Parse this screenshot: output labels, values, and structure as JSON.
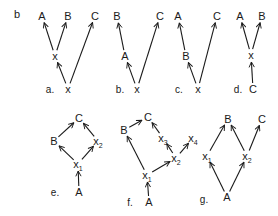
{
  "figure_label": "b",
  "colors": {
    "ink": "#1a1a1a",
    "background": "#ffffff"
  },
  "panels": [
    {
      "id": "a",
      "caption": "a.",
      "caption_pos": [
        50,
        93
      ],
      "nodes": [
        {
          "id": "A",
          "label": "A",
          "pos": [
            42,
            20
          ]
        },
        {
          "id": "B",
          "label": "B",
          "pos": [
            68,
            20
          ]
        },
        {
          "id": "C",
          "label": "C",
          "pos": [
            95,
            20
          ]
        },
        {
          "id": "x",
          "label": "x",
          "pos": [
            55,
            60
          ]
        },
        {
          "id": "x0",
          "label": "x",
          "pos": [
            68,
            93
          ]
        }
      ],
      "edges": [
        [
          "x0",
          "x"
        ],
        [
          "x",
          "A"
        ],
        [
          "x",
          "B"
        ],
        [
          "x0",
          "C"
        ]
      ]
    },
    {
      "id": "b",
      "caption": "b.",
      "caption_pos": [
        120,
        93
      ],
      "nodes": [
        {
          "id": "B",
          "label": "B",
          "pos": [
            117,
            20
          ]
        },
        {
          "id": "C",
          "label": "C",
          "pos": [
            160,
            20
          ]
        },
        {
          "id": "A",
          "label": "A",
          "pos": [
            125,
            60
          ]
        },
        {
          "id": "x",
          "label": "x",
          "pos": [
            137,
            93
          ]
        }
      ],
      "edges": [
        [
          "x",
          "A"
        ],
        [
          "A",
          "B"
        ],
        [
          "x",
          "C"
        ]
      ]
    },
    {
      "id": "c",
      "caption": "c.",
      "caption_pos": [
        179,
        93
      ],
      "nodes": [
        {
          "id": "A",
          "label": "A",
          "pos": [
            178,
            20
          ]
        },
        {
          "id": "C",
          "label": "C",
          "pos": [
            217,
            20
          ]
        },
        {
          "id": "B",
          "label": "B",
          "pos": [
            186,
            60
          ]
        },
        {
          "id": "x",
          "label": "x",
          "pos": [
            198,
            93
          ]
        }
      ],
      "edges": [
        [
          "x",
          "B"
        ],
        [
          "B",
          "A"
        ],
        [
          "x",
          "C"
        ]
      ]
    },
    {
      "id": "d",
      "caption": "d.",
      "caption_pos": [
        238,
        93
      ],
      "nodes": [
        {
          "id": "A",
          "label": "A",
          "pos": [
            240,
            20
          ]
        },
        {
          "id": "B",
          "label": "B",
          "pos": [
            262,
            20
          ]
        },
        {
          "id": "x",
          "label": "x",
          "pos": [
            251,
            59
          ]
        },
        {
          "id": "C",
          "label": "C",
          "pos": [
            253,
            93
          ]
        }
      ],
      "edges": [
        [
          "C",
          "x"
        ],
        [
          "x",
          "A"
        ],
        [
          "x",
          "B"
        ]
      ]
    },
    {
      "id": "e",
      "caption": "e.",
      "caption_pos": [
        55,
        196
      ],
      "nodes": [
        {
          "id": "C",
          "label": "C",
          "sub": "",
          "pos": [
            79,
            122
          ]
        },
        {
          "id": "B",
          "label": "B",
          "sub": "",
          "pos": [
            54,
            145
          ]
        },
        {
          "id": "x2",
          "label": "x",
          "sub": "2",
          "pos": [
            98,
            145
          ]
        },
        {
          "id": "x1",
          "label": "x",
          "sub": "1",
          "pos": [
            78,
            168
          ]
        },
        {
          "id": "A",
          "label": "A",
          "sub": "",
          "pos": [
            79,
            196
          ]
        }
      ],
      "edges": [
        [
          "A",
          "x1"
        ],
        [
          "x1",
          "B"
        ],
        [
          "x1",
          "x2"
        ],
        [
          "B",
          "C"
        ],
        [
          "x2",
          "C"
        ]
      ]
    },
    {
      "id": "f",
      "caption": "f.",
      "caption_pos": [
        130,
        206
      ],
      "nodes": [
        {
          "id": "C",
          "label": "C",
          "sub": "",
          "pos": [
            148,
            121
          ]
        },
        {
          "id": "B",
          "label": "B",
          "sub": "",
          "pos": [
            124,
            134
          ]
        },
        {
          "id": "x3",
          "label": "x",
          "sub": "3",
          "pos": [
            163,
            142
          ]
        },
        {
          "id": "x4",
          "label": "x",
          "sub": "4",
          "pos": [
            193,
            142
          ]
        },
        {
          "id": "x2",
          "label": "x",
          "sub": "2",
          "pos": [
            176,
            162
          ]
        },
        {
          "id": "x1",
          "label": "x",
          "sub": "1",
          "pos": [
            147,
            179
          ]
        },
        {
          "id": "A",
          "label": "A",
          "sub": "",
          "pos": [
            149,
            206
          ]
        }
      ],
      "edges": [
        [
          "A",
          "x1"
        ],
        [
          "x1",
          "B"
        ],
        [
          "x1",
          "x2"
        ],
        [
          "x2",
          "x3"
        ],
        [
          "x2",
          "x4"
        ],
        [
          "x3",
          "C"
        ],
        [
          "B",
          "C"
        ]
      ]
    },
    {
      "id": "g",
      "caption": "g.",
      "caption_pos": [
        204,
        203
      ],
      "nodes": [
        {
          "id": "B",
          "label": "B",
          "sub": "",
          "pos": [
            228,
            123
          ]
        },
        {
          "id": "C",
          "label": "C",
          "sub": "",
          "pos": [
            262,
            123
          ]
        },
        {
          "id": "x1",
          "label": "x",
          "sub": "1",
          "pos": [
            207,
            160
          ]
        },
        {
          "id": "x2",
          "label": "x",
          "sub": "2",
          "pos": [
            247,
            160
          ]
        },
        {
          "id": "A",
          "label": "A",
          "sub": "",
          "pos": [
            227,
            201
          ]
        }
      ],
      "edges": [
        [
          "A",
          "x1"
        ],
        [
          "A",
          "x2"
        ],
        [
          "x1",
          "B"
        ],
        [
          "x2",
          "B"
        ],
        [
          "x2",
          "C"
        ]
      ]
    }
  ]
}
